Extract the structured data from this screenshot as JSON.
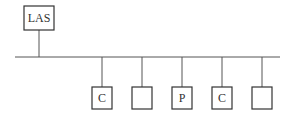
{
  "diagram": {
    "top_node": {
      "label": "LAS"
    },
    "bus": {
      "name": "fieldbus"
    },
    "nodes": [
      {
        "label": "C"
      },
      {
        "label": ""
      },
      {
        "label": "P"
      },
      {
        "label": "C"
      },
      {
        "label": ""
      }
    ]
  }
}
